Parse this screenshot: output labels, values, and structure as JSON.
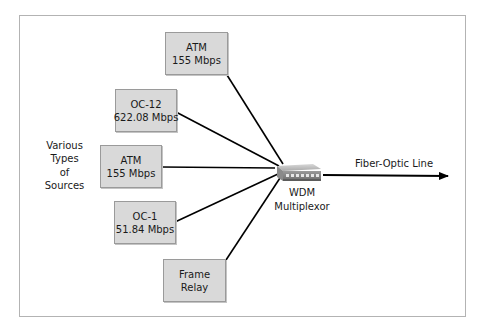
{
  "diagram": {
    "type": "multiplexing",
    "side_label": [
      "Various",
      "Types",
      "of",
      "Sources"
    ],
    "sources": [
      {
        "id": "atm-top",
        "line1": "ATM",
        "line2": "155 Mbps"
      },
      {
        "id": "oc12",
        "line1": "OC-12",
        "line2": "622.08 Mbps"
      },
      {
        "id": "atm-mid",
        "line1": "ATM",
        "line2": "155 Mbps"
      },
      {
        "id": "oc1",
        "line1": "OC-1",
        "line2": "51.84 Mbps"
      },
      {
        "id": "frame-relay",
        "line1": "Frame",
        "line2": "Relay"
      }
    ],
    "multiplexor": {
      "line1": "WDM",
      "line2": "Multiplexor"
    },
    "output": {
      "label": "Fiber-Optic Line"
    },
    "colors": {
      "box_fill": "#d9d9d9",
      "box_border": "#9a9a9a",
      "line": "#000000",
      "frame": "#b3b3b3"
    }
  }
}
